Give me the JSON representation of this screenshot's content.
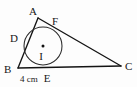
{
  "figure": {
    "background_color": "#fdfdfd",
    "stroke_color": "#141414",
    "labels": {
      "vertex_a": "A",
      "vertex_b": "B",
      "vertex_c": "C",
      "touch_d": "D",
      "touch_e": "E",
      "touch_f": "F",
      "center_i": "I",
      "measure_be": "4 cm"
    },
    "geometry": {
      "vertex_a": {
        "x": 38,
        "y": 18
      },
      "vertex_b": {
        "x": 18,
        "y": 68
      },
      "vertex_c": {
        "x": 121,
        "y": 66
      },
      "incircle_center": {
        "x": 43,
        "y": 46
      },
      "incircle_radius": 19,
      "touch_d": {
        "x": 26,
        "y": 36
      },
      "touch_e": {
        "x": 44,
        "y": 67
      },
      "touch_f": {
        "x": 53,
        "y": 29
      }
    },
    "label_positions": {
      "vertex_a": {
        "x": 33,
        "y": 15
      },
      "vertex_b": {
        "x": 4,
        "y": 73
      },
      "vertex_c": {
        "x": 125,
        "y": 70
      },
      "touch_d": {
        "x": 14,
        "y": 42
      },
      "touch_e": {
        "x": 44,
        "y": 81
      },
      "touch_f": {
        "x": 54,
        "y": 25
      },
      "center_i": {
        "x": 40,
        "y": 59
      },
      "center_dot": {
        "x": 43,
        "y": 46
      },
      "measure_be": {
        "x": 20,
        "y": 81
      }
    }
  }
}
